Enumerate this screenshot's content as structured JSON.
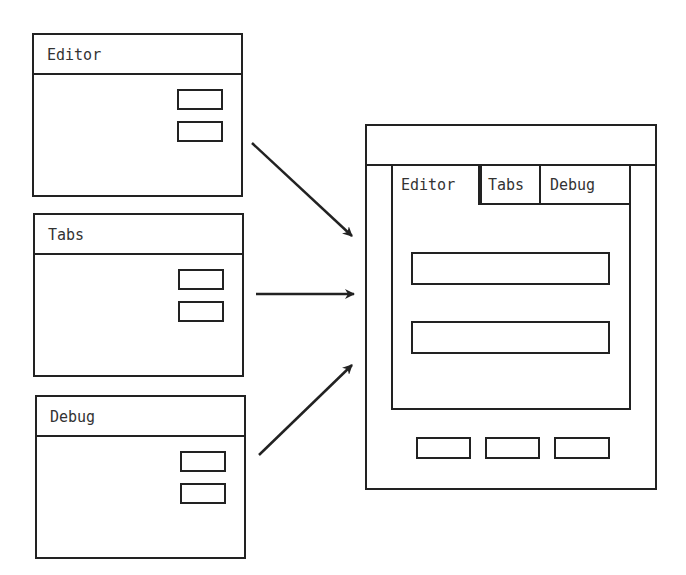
{
  "source_windows": [
    {
      "title": "Editor",
      "buttons": 2
    },
    {
      "title": "Tabs",
      "buttons": 2
    },
    {
      "title": "Debug",
      "buttons": 2
    }
  ],
  "main_window": {
    "tabs": [
      {
        "label": "Editor",
        "active": true
      },
      {
        "label": "Tabs",
        "active": false
      },
      {
        "label": "Debug",
        "active": false
      }
    ],
    "fields": 2,
    "bottom_buttons": 3
  },
  "colors": {
    "stroke": "#222222",
    "background": "#ffffff"
  }
}
